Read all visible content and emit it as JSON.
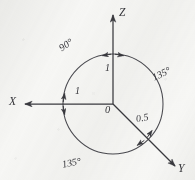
{
  "diagram": {
    "background_color": "#f7f7f5",
    "ink_color": "#3a3a3f",
    "axes": [
      {
        "name": "x-axis",
        "label": "X",
        "direction": "left",
        "scale_label": "1",
        "arrow": true
      },
      {
        "name": "z-axis",
        "label": "Z",
        "direction": "up",
        "scale_label": "1",
        "arrow": true
      },
      {
        "name": "y-axis",
        "label": "Y",
        "direction": "down-right",
        "scale_label": "0.5",
        "arrow": true
      }
    ],
    "origin_label": "0",
    "angles": [
      {
        "name": "angle-x-z",
        "label": "90°",
        "position": "upper-left"
      },
      {
        "name": "angle-z-y",
        "label": "135°",
        "position": "right"
      },
      {
        "name": "angle-y-x",
        "label": "135°",
        "position": "lower-left"
      }
    ],
    "dimensions": [
      {
        "name": "dim-z",
        "label": "1"
      },
      {
        "name": "dim-x",
        "label": "1"
      },
      {
        "name": "dim-y",
        "label": "0.5"
      }
    ],
    "circle": {
      "name": "reference-circle",
      "radius_px": 50
    }
  }
}
